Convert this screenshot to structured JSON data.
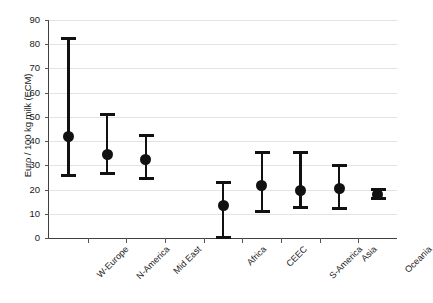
{
  "chart_data": {
    "type": "scatter",
    "title": "",
    "xlabel": "",
    "ylabel": "Euro / 100 kg milk (ECM)",
    "ylim": [
      0,
      90
    ],
    "yticks": [
      0,
      10,
      20,
      30,
      40,
      50,
      60,
      70,
      80,
      90
    ],
    "grid": true,
    "legend": "none",
    "categories": [
      "W-Europe",
      "N-America",
      "Mid East",
      "",
      "Africa",
      "CEEC",
      "S-America",
      "Asia",
      "Oceania"
    ],
    "series": [
      {
        "name": "Cost of milk production",
        "points": [
          {
            "category": "W-Europe",
            "value": 42.0,
            "low": 25.5,
            "high": 82.5
          },
          {
            "category": "N-America",
            "value": 34.3,
            "low": 26.3,
            "high": 51.0
          },
          {
            "category": "Mid East",
            "value": 32.4,
            "low": 24.3,
            "high": 42.5
          },
          {
            "category": "Africa",
            "value": 13.5,
            "low": 0.2,
            "high": 23.0
          },
          {
            "category": "CEEC",
            "value": 21.8,
            "low": 10.8,
            "high": 35.7
          },
          {
            "category": "S-America",
            "value": 19.8,
            "low": 12.3,
            "high": 35.7
          },
          {
            "category": "Asia",
            "value": 20.5,
            "low": 11.9,
            "high": 30.0
          },
          {
            "category": "Oceania",
            "value": 18.0,
            "low": 16.2,
            "high": 20.4
          }
        ]
      }
    ],
    "marker_color": "#111111",
    "grid_color": "#e3e3e3",
    "axis_color": "#3f3f3f"
  },
  "axis": {
    "y_title": "Euro / 100 kg milk (ECM)",
    "tick_0": "0",
    "tick_10": "10",
    "tick_20": "20",
    "tick_30": "30",
    "tick_40": "40",
    "tick_50": "50",
    "tick_60": "60",
    "tick_70": "70",
    "tick_80": "80",
    "tick_90": "90"
  },
  "xlabels": {
    "l0": "W-Europe",
    "l1": "N-America",
    "l2": "Mid East",
    "l3": "Africa",
    "l4": "CEEC",
    "l5": "S-America",
    "l6": "Asia",
    "l7": "Oceania"
  }
}
